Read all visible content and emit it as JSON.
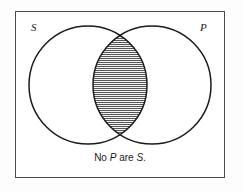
{
  "figure": {
    "type": "venn-diagram",
    "name": "categorical-syllogism-venn",
    "frame": {
      "border_color": "#4a4a4a",
      "background_color": "#ffffff"
    },
    "labels": {
      "left_set": "S",
      "right_set": "P"
    },
    "caption": {
      "prefix": "No ",
      "term_one": "P",
      "middle": " are ",
      "term_two": "S",
      "suffix": "."
    },
    "circles": [
      {
        "name": "left-circle-s",
        "label": "S",
        "cx": 88,
        "cy": 85,
        "r": 59,
        "stroke": "#1a1a1a",
        "fill": "none"
      },
      {
        "name": "right-circle-p",
        "label": "P",
        "cx": 152,
        "cy": 85,
        "r": 59,
        "stroke": "#1a1a1a",
        "fill": "none"
      }
    ],
    "shaded_region": {
      "name": "intersection-lens",
      "description": "intersection of S and P",
      "fill_style": "horizontal-hatch",
      "hatch_color": "#4f4f4f",
      "hatch_spacing_px": 2,
      "base_fill": "#f2f2f2"
    }
  }
}
